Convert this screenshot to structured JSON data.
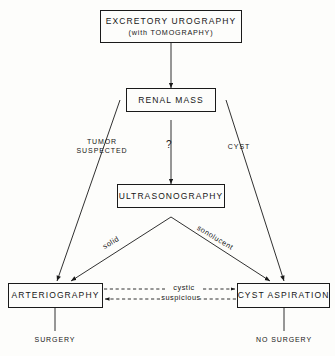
{
  "diagram": {
    "title_flow": "Excretory urography diagnostic algorithm for renal mass",
    "nodes": {
      "excretory_urography": {
        "line1": "EXCRETORY  UROGRAPHY",
        "line2": "(with  TOMOGRAPHY)"
      },
      "renal_mass": {
        "line1": "RENAL  MASS"
      },
      "ultrasonography": {
        "line1": "ULTRASONOGRAPHY"
      },
      "arteriography": {
        "line1": "ARTERIOGRAPHY"
      },
      "cyst_aspiration": {
        "line1": "CYST   ASPIRATION"
      }
    },
    "edge_labels": {
      "tumor_suspected_line1": "TUMOR",
      "tumor_suspected_line2": "SUSPECTED",
      "question": "?",
      "cyst": "CYST",
      "solid": "solid",
      "sonolucent": "sonolucent",
      "cystic": "cystic",
      "suspicious": "suspicious"
    },
    "outcomes": {
      "surgery": "SURGERY",
      "no_surgery": "NO SURGERY"
    },
    "colors": {
      "ink": "#1a1a1a",
      "background": "#fdfdfb"
    }
  }
}
